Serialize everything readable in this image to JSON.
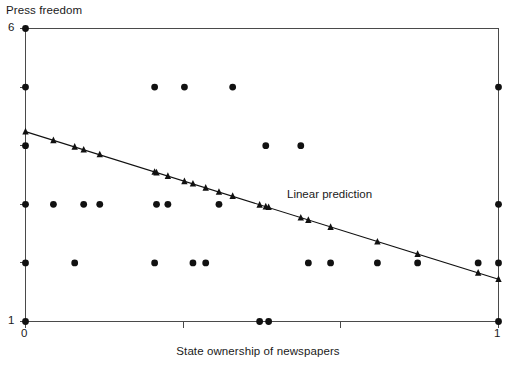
{
  "chart_data": {
    "type": "scatter",
    "title": "",
    "xlabel": "State ownership of newspapers",
    "ylabel": "Press freedom",
    "xlim": [
      0,
      1
    ],
    "ylim": [
      1,
      6
    ],
    "grid": false,
    "x_ticks": [
      {
        "value": 0,
        "label": "0"
      },
      {
        "value": 0.3333,
        "label": ""
      },
      {
        "value": 0.6667,
        "label": ""
      },
      {
        "value": 1,
        "label": "1"
      }
    ],
    "y_ticks": [
      {
        "value": 6,
        "label": "6"
      },
      {
        "value": 5,
        "label": ""
      },
      {
        "value": 4,
        "label": ""
      },
      {
        "value": 3,
        "label": ""
      },
      {
        "value": 2,
        "label": ""
      },
      {
        "value": 1,
        "label": "1"
      }
    ],
    "series": [
      {
        "name": "Press freedom",
        "type": "scatter",
        "marker": "circle",
        "color": "#111111",
        "points": [
          {
            "x": 0.0,
            "y": 6.0
          },
          {
            "x": 0.0,
            "y": 5.0
          },
          {
            "x": 0.273,
            "y": 5.0
          },
          {
            "x": 0.336,
            "y": 5.0
          },
          {
            "x": 0.438,
            "y": 5.0
          },
          {
            "x": 1.0,
            "y": 5.0
          },
          {
            "x": 0.0,
            "y": 4.0
          },
          {
            "x": 0.508,
            "y": 4.0
          },
          {
            "x": 0.582,
            "y": 4.0
          },
          {
            "x": 0.0,
            "y": 3.0
          },
          {
            "x": 0.059,
            "y": 3.0
          },
          {
            "x": 0.123,
            "y": 3.0
          },
          {
            "x": 0.157,
            "y": 3.0
          },
          {
            "x": 0.277,
            "y": 3.0
          },
          {
            "x": 0.301,
            "y": 3.0
          },
          {
            "x": 0.409,
            "y": 3.0
          },
          {
            "x": 1.0,
            "y": 3.0
          },
          {
            "x": 0.0,
            "y": 2.0
          },
          {
            "x": 0.104,
            "y": 2.0
          },
          {
            "x": 0.273,
            "y": 2.0
          },
          {
            "x": 0.354,
            "y": 2.0
          },
          {
            "x": 0.381,
            "y": 2.0
          },
          {
            "x": 0.598,
            "y": 2.0
          },
          {
            "x": 0.645,
            "y": 2.0
          },
          {
            "x": 0.744,
            "y": 2.0
          },
          {
            "x": 0.829,
            "y": 2.0
          },
          {
            "x": 0.957,
            "y": 2.0
          },
          {
            "x": 1.0,
            "y": 2.0
          },
          {
            "x": 0.0,
            "y": 1.0
          },
          {
            "x": 0.495,
            "y": 1.0
          },
          {
            "x": 0.514,
            "y": 1.0
          },
          {
            "x": 1.0,
            "y": 1.0
          }
        ]
      },
      {
        "name": "Linear prediction",
        "type": "line",
        "marker": "triangle",
        "color": "#111111",
        "endpoints": {
          "x0": 0.0,
          "y0": 4.24,
          "x1": 1.0,
          "y1": 1.72
        },
        "points": [
          {
            "x": 0.0,
            "y": 4.24
          },
          {
            "x": 0.059,
            "y": 4.09
          },
          {
            "x": 0.104,
            "y": 3.98
          },
          {
            "x": 0.123,
            "y": 3.93
          },
          {
            "x": 0.157,
            "y": 3.85
          },
          {
            "x": 0.273,
            "y": 3.55
          },
          {
            "x": 0.277,
            "y": 3.54
          },
          {
            "x": 0.301,
            "y": 3.48
          },
          {
            "x": 0.336,
            "y": 3.39
          },
          {
            "x": 0.354,
            "y": 3.35
          },
          {
            "x": 0.381,
            "y": 3.28
          },
          {
            "x": 0.409,
            "y": 3.21
          },
          {
            "x": 0.438,
            "y": 3.14
          },
          {
            "x": 0.495,
            "y": 2.99
          },
          {
            "x": 0.508,
            "y": 2.96
          },
          {
            "x": 0.514,
            "y": 2.95
          },
          {
            "x": 0.582,
            "y": 2.77
          },
          {
            "x": 0.598,
            "y": 2.73
          },
          {
            "x": 0.645,
            "y": 2.61
          },
          {
            "x": 0.744,
            "y": 2.36
          },
          {
            "x": 0.829,
            "y": 2.15
          },
          {
            "x": 0.957,
            "y": 1.83
          },
          {
            "x": 1.0,
            "y": 1.72
          }
        ],
        "annotation": "Linear prediction"
      }
    ]
  },
  "labels": {
    "y_axis_title": "Press freedom",
    "x_axis_title": "State ownership of newspapers",
    "y_tick_top": "6",
    "y_tick_bottom": "1",
    "x_tick_left": "0",
    "x_tick_right": "1",
    "series_annotation": "Linear prediction"
  },
  "colors": {
    "axis": "#4a4a4a",
    "marker": "#111111",
    "line": "#111111",
    "text": "#1a1a1a",
    "background": "#ffffff"
  }
}
